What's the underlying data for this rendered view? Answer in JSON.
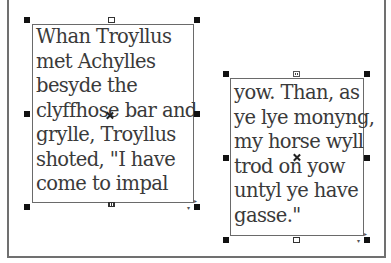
{
  "canvas": {
    "background": "#ffffff",
    "border_color": "#707070"
  },
  "frames": [
    {
      "id": "frame-1",
      "lines": [
        "Whan Troyllus",
        "met Achylles",
        "besyde the",
        "clyffhose bar and",
        "grylle, Troyllus",
        "shoted, \"I have",
        "come to impal"
      ],
      "in_port": "empty",
      "out_port": "overflow"
    },
    {
      "id": "frame-2",
      "lines": [
        "yow. Than, as",
        "ye lye monyng,",
        "my horse wyll",
        "trod on yow",
        "untyl ye have",
        "gasse.\""
      ],
      "in_port": "threaded",
      "out_port": "empty"
    }
  ],
  "icons": {
    "handle": "resize-handle-icon",
    "center": "center-point-icon",
    "in_port": "in-port-icon",
    "out_port": "out-port-icon",
    "corner": "corner-options-icon"
  },
  "colors": {
    "text": "#3a3a3a",
    "frame_border": "#6a6a6a",
    "handle": "#111111"
  }
}
